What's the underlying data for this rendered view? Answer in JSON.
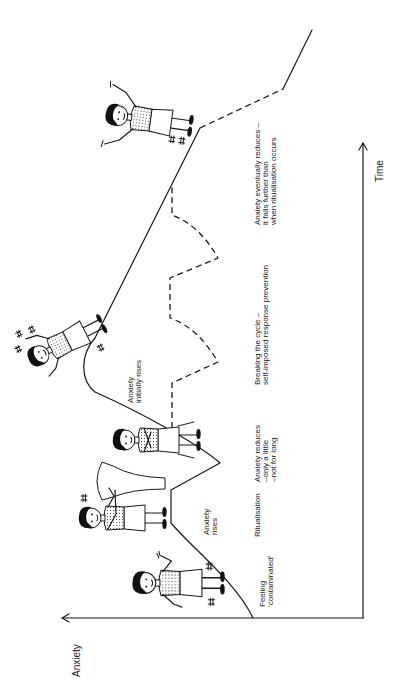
{
  "axes": {
    "y_label": "Anxiety",
    "x_label": "Time"
  },
  "labels": {
    "feeling_contaminated": [
      "Feeling",
      "‘contaminated’"
    ],
    "anxiety_rises": [
      "Anxiety",
      "rises"
    ],
    "ritualisation": [
      "Ritualisation"
    ],
    "anxiety_reduces": [
      "Anxiety reduces",
      "–only a little",
      "–not for long"
    ],
    "anxiety_initially_rises": [
      "Anxiety",
      "initially rises"
    ],
    "breaking_the_cycle": [
      "Breaking the cycle –",
      "self-imposed response prevention"
    ],
    "anxiety_eventually_reduces": [
      "Anxiety eventually reduces –",
      "it falls further than",
      "when ritualisation occurs"
    ]
  },
  "figures": [
    "person-feeling-contaminated-icon",
    "person-washing-at-sink-icon",
    "person-sitting-arms-crossed-icon",
    "person-agitated-icon",
    "person-relieved-arms-raised-icon"
  ],
  "colors": {
    "ink": "#1a1a1a",
    "background": "#ffffff"
  }
}
